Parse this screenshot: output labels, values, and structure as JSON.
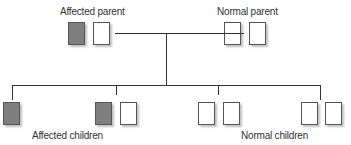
{
  "labels": {
    "affected_parent": "Affected parent",
    "normal_parent": "Normal parent",
    "affected_children": "Affected children",
    "normal_children": "Normal children"
  },
  "colors": {
    "affected_fill": "#7f7f7f",
    "normal_fill": "#ffffff",
    "line": "#333333"
  },
  "parents": [
    {
      "name": "Affected parent",
      "alleles": [
        "affected",
        "normal"
      ]
    },
    {
      "name": "Normal parent",
      "alleles": [
        "normal",
        "normal"
      ]
    }
  ],
  "children": [
    {
      "alleles": [
        "affected"
      ],
      "group": "Affected children"
    },
    {
      "alleles": [
        "affected",
        "normal"
      ],
      "group": "Affected children"
    },
    {
      "alleles": [
        "normal",
        "normal"
      ],
      "group": "Normal children"
    },
    {
      "alleles": [
        "normal",
        "normal"
      ],
      "group": "Normal children"
    }
  ]
}
